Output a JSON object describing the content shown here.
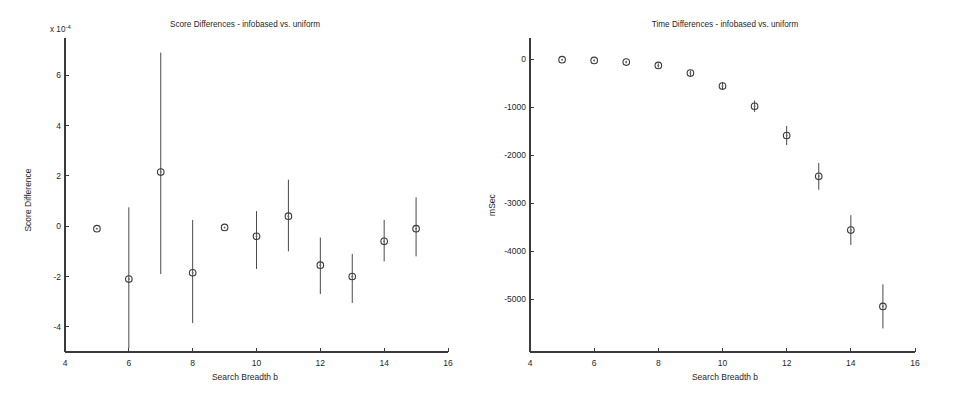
{
  "figure": {
    "background": "#ffffff",
    "marker_color": "#3a3a3a",
    "errorbar_color": "#4a4a4a",
    "axis_color": "#3b3b3b"
  },
  "chart_data": [
    {
      "type": "scatter",
      "panel": "left",
      "title": "Score Differences - infobased vs. uniform",
      "xlabel": "Search Breadth b",
      "ylabel": "Score Difference",
      "y_exponent_label": "x 10",
      "y_exponent_value": "-4",
      "xlim": [
        4,
        16
      ],
      "ylim": [
        -5.0,
        7.4
      ],
      "xticks": [
        4,
        6,
        8,
        10,
        12,
        14,
        16
      ],
      "yticks": [
        6,
        4,
        2,
        0,
        -2,
        -4
      ],
      "xtick_labels": [
        "4",
        "6",
        "8",
        "10",
        "12",
        "14",
        "16"
      ],
      "ytick_labels": [
        "6",
        "4",
        "2",
        "0",
        "-2",
        "-4"
      ],
      "grid": false,
      "legend": false,
      "errorbars": true,
      "x": [
        5,
        6,
        7,
        8,
        9,
        10,
        11,
        12,
        13,
        14,
        15
      ],
      "values": [
        -0.1,
        -2.1,
        2.15,
        -1.85,
        -0.05,
        -0.4,
        0.4,
        -1.55,
        -2.0,
        -0.6,
        -0.1
      ],
      "err_low": [
        -0.12,
        -4.85,
        -1.9,
        -3.85,
        -0.07,
        -1.7,
        -1.0,
        -2.7,
        -3.05,
        -1.4,
        -1.2
      ],
      "err_high": [
        -0.08,
        0.75,
        6.9,
        0.25,
        -0.03,
        0.6,
        1.85,
        -0.45,
        -1.1,
        0.25,
        1.15
      ]
    },
    {
      "type": "scatter",
      "panel": "right",
      "title": "Time Differences - infobased vs. uniform",
      "xlabel": "Search Breadth b",
      "ylabel": "mSec",
      "xlim": [
        4,
        16
      ],
      "ylim": [
        -6100,
        400
      ],
      "xticks": [
        4,
        6,
        8,
        10,
        12,
        14,
        16
      ],
      "yticks": [
        0,
        -1000,
        -2000,
        -3000,
        -4000,
        -5000
      ],
      "xtick_labels": [
        "4",
        "6",
        "8",
        "10",
        "12",
        "14",
        "16"
      ],
      "ytick_labels": [
        "0",
        "-1000",
        "-2000",
        "-3000",
        "-4000",
        "-5000"
      ],
      "grid": false,
      "legend": false,
      "errorbars": true,
      "x": [
        5,
        6,
        7,
        8,
        9,
        10,
        11,
        12,
        13,
        14,
        15
      ],
      "values": [
        -10,
        -25,
        -60,
        -130,
        -290,
        -560,
        -980,
        -1590,
        -2440,
        -3560,
        -5150
      ],
      "err_low": [
        -20,
        -40,
        -85,
        -175,
        -345,
        -640,
        -1100,
        -1790,
        -2720,
        -3870,
        -5610
      ],
      "err_high": [
        0,
        -10,
        -35,
        -85,
        -235,
        -480,
        -860,
        -1390,
        -2160,
        -3250,
        -4690
      ]
    }
  ]
}
